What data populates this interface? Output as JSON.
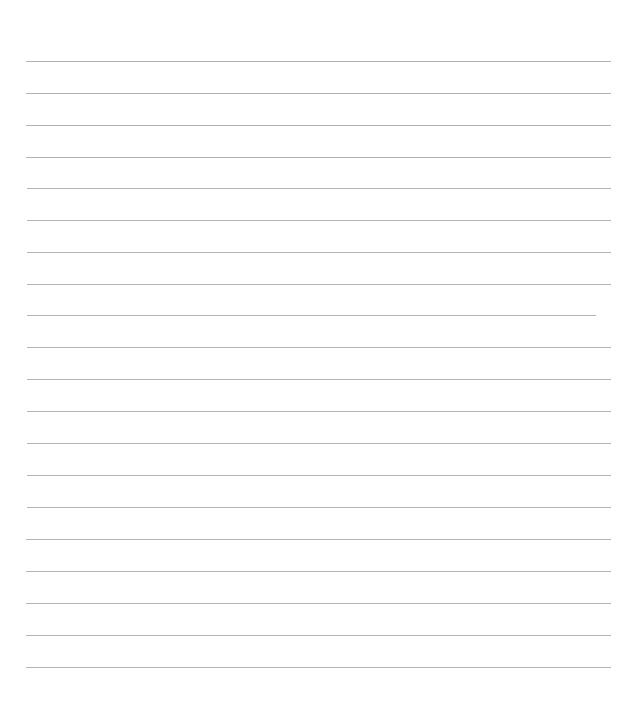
{
  "page": {
    "type": "blank ruled sheet",
    "background_color": "#ffffff",
    "rule_color": "#b4b4b4",
    "lines": [
      {
        "y": 61,
        "x1": 26,
        "x2": 611
      },
      {
        "y": 93,
        "x1": 26,
        "x2": 611
      },
      {
        "y": 125,
        "x1": 26,
        "x2": 611
      },
      {
        "y": 157,
        "x1": 26,
        "x2": 611
      },
      {
        "y": 188,
        "x1": 27,
        "x2": 611
      },
      {
        "y": 220,
        "x1": 27,
        "x2": 611
      },
      {
        "y": 252,
        "x1": 27,
        "x2": 611
      },
      {
        "y": 284,
        "x1": 27,
        "x2": 611
      },
      {
        "y": 315,
        "x1": 27,
        "x2": 596
      },
      {
        "y": 347,
        "x1": 27,
        "x2": 611
      },
      {
        "y": 379,
        "x1": 27,
        "x2": 611
      },
      {
        "y": 411,
        "x1": 27,
        "x2": 611
      },
      {
        "y": 443,
        "x1": 27,
        "x2": 611
      },
      {
        "y": 475,
        "x1": 27,
        "x2": 611
      },
      {
        "y": 507,
        "x1": 27,
        "x2": 611
      },
      {
        "y": 539,
        "x1": 26,
        "x2": 611
      },
      {
        "y": 571,
        "x1": 26,
        "x2": 611
      },
      {
        "y": 603,
        "x1": 26,
        "x2": 611
      },
      {
        "y": 635,
        "x1": 26,
        "x2": 611
      },
      {
        "y": 667,
        "x1": 26,
        "x2": 611
      }
    ]
  }
}
